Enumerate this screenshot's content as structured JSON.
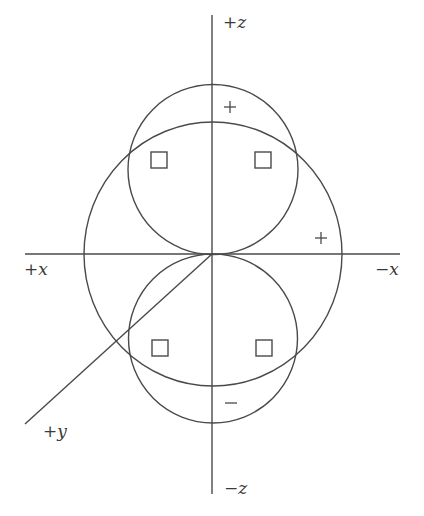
{
  "diagram": {
    "title": "",
    "axes": {
      "pos_z": "+z",
      "neg_z": "−z",
      "pos_x": "+x",
      "neg_x": "−x",
      "pos_y": "+y"
    },
    "lobe_signs": {
      "upper_lobe": "+",
      "lower_lobe": "−",
      "outer_sphere": "+"
    },
    "nodes_markers": 4,
    "colors": {
      "line": "#4a4a4a",
      "text": "#3a3a3a",
      "background": "#ffffff"
    }
  }
}
